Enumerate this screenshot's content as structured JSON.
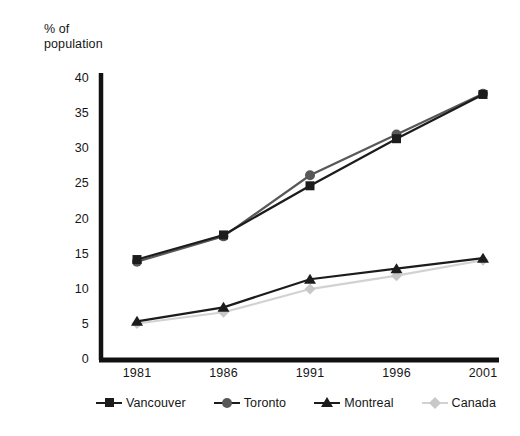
{
  "chart_data": {
    "type": "line",
    "title": "",
    "xlabel": "",
    "ylabel": "% of\npopulation",
    "categories": [
      "1981",
      "1986",
      "1991",
      "1996",
      "2001"
    ],
    "ylim": [
      0,
      40
    ],
    "yticks": [
      "0",
      "5",
      "10",
      "15",
      "20",
      "25",
      "30",
      "35",
      "40"
    ],
    "grid": false,
    "legend_position": "bottom",
    "series": [
      {
        "name": "Vancouver",
        "marker": "square",
        "color": "#1c1c1c",
        "values": [
          14.3,
          17.8,
          24.8,
          31.5,
          37.8
        ]
      },
      {
        "name": "Toronto",
        "marker": "circle",
        "color": "#585858",
        "values": [
          14.0,
          17.6,
          26.3,
          32.1,
          37.9
        ]
      },
      {
        "name": "Montreal",
        "marker": "triangle",
        "color": "#1c1c1c",
        "values": [
          5.5,
          7.5,
          11.5,
          13.0,
          14.5
        ]
      },
      {
        "name": "Canada",
        "marker": "diamond",
        "color": "#c8c8c8",
        "values": [
          5.2,
          6.8,
          10.1,
          12.0,
          14.2
        ]
      }
    ]
  }
}
